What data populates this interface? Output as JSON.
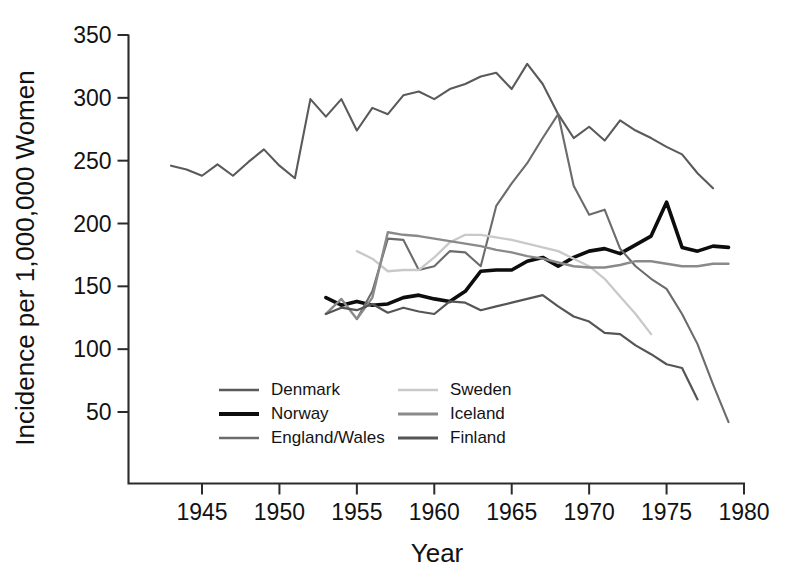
{
  "chart_data": {
    "type": "line",
    "title": "",
    "subtitle": "",
    "xlabel": "Year",
    "ylabel": "Incidence per 1,000,000 Women",
    "xlim": [
      1942,
      1980
    ],
    "ylim": [
      0,
      350
    ],
    "xticks": [
      1945,
      1950,
      1955,
      1960,
      1965,
      1970,
      1975,
      1980
    ],
    "yticks": [
      50,
      100,
      150,
      200,
      250,
      300,
      350
    ],
    "grid": false,
    "legend_position": "inside-lower-left",
    "annotations": [],
    "series": [
      {
        "name": "Denmark",
        "color": "#5a5a5a",
        "width": 2.1,
        "x": [
          1943,
          1944,
          1945,
          1946,
          1947,
          1948,
          1949,
          1950,
          1951,
          1952,
          1953,
          1954,
          1955,
          1956,
          1957,
          1958,
          1959,
          1960,
          1961,
          1962,
          1963,
          1964,
          1965,
          1966,
          1967,
          1968,
          1969,
          1970,
          1971,
          1972,
          1973,
          1974,
          1975,
          1976,
          1977,
          1978
        ],
        "y": [
          246,
          243,
          238,
          247,
          238,
          249,
          259,
          246,
          236,
          299,
          285,
          299,
          274,
          292,
          287,
          302,
          305,
          299,
          307,
          311,
          317,
          320,
          307,
          327,
          311,
          287,
          268,
          277,
          266,
          282,
          274,
          268,
          261,
          255,
          240,
          228
        ]
      },
      {
        "name": "Norway",
        "color": "#0d0d0d",
        "width": 3.6,
        "x": [
          1953,
          1954,
          1955,
          1956,
          1957,
          1958,
          1959,
          1960,
          1961,
          1962,
          1963,
          1964,
          1965,
          1966,
          1967,
          1968,
          1969,
          1970,
          1971,
          1972,
          1973,
          1974,
          1975,
          1976,
          1977,
          1978,
          1979
        ],
        "y": [
          141,
          135,
          138,
          135,
          136,
          141,
          143,
          140,
          138,
          146,
          162,
          163,
          163,
          170,
          173,
          166,
          173,
          178,
          180,
          176,
          183,
          190,
          217,
          181,
          178,
          182,
          181
        ]
      },
      {
        "name": "England/Wales",
        "color": "#6b6b6b",
        "width": 2.1,
        "x": [
          1955,
          1956,
          1957,
          1958,
          1959,
          1960,
          1961,
          1962,
          1963,
          1964,
          1965,
          1966,
          1967,
          1968,
          1969,
          1970,
          1971,
          1972,
          1973,
          1974,
          1975,
          1976,
          1977,
          1978,
          1979
        ],
        "y": [
          124,
          146,
          188,
          187,
          163,
          166,
          178,
          177,
          166,
          214,
          232,
          248,
          268,
          287,
          230,
          207,
          211,
          180,
          166,
          156,
          148,
          128,
          104,
          72,
          42
        ]
      },
      {
        "name": "Sweden",
        "color": "#c9c9c9",
        "width": 2.3,
        "x": [
          1955,
          1956,
          1957,
          1958,
          1959,
          1960,
          1961,
          1962,
          1963,
          1964,
          1965,
          1966,
          1967,
          1968,
          1969,
          1970,
          1971,
          1972,
          1973,
          1974
        ],
        "y": [
          178,
          172,
          162,
          163,
          163,
          173,
          185,
          191,
          191,
          189,
          187,
          184,
          181,
          178,
          172,
          166,
          156,
          142,
          128,
          112
        ]
      },
      {
        "name": "Iceland",
        "color": "#8a8a8a",
        "width": 2.4,
        "x": [
          1953,
          1954,
          1955,
          1956,
          1957,
          1958,
          1959,
          1960,
          1961,
          1962,
          1963,
          1964,
          1965,
          1966,
          1967,
          1968,
          1969,
          1970,
          1971,
          1972,
          1973,
          1974,
          1975,
          1976,
          1977,
          1978,
          1979
        ],
        "y": [
          128,
          140,
          124,
          141,
          193,
          191,
          190,
          188,
          186,
          184,
          182,
          179,
          177,
          174,
          172,
          169,
          166,
          165,
          165,
          167,
          170,
          170,
          168,
          166,
          166,
          168,
          168
        ]
      },
      {
        "name": "Finland",
        "color": "#555555",
        "width": 2.2,
        "x": [
          1953,
          1954,
          1955,
          1956,
          1957,
          1958,
          1959,
          1960,
          1961,
          1962,
          1963,
          1964,
          1965,
          1966,
          1967,
          1968,
          1969,
          1970,
          1971,
          1972,
          1973,
          1974,
          1975,
          1976,
          1977
        ],
        "y": [
          128,
          133,
          131,
          136,
          129,
          133,
          130,
          128,
          138,
          137,
          131,
          134,
          137,
          140,
          143,
          134,
          126,
          122,
          113,
          112,
          103,
          96,
          88,
          85,
          60
        ]
      }
    ]
  },
  "legend": {
    "entries": [
      {
        "label": "Denmark",
        "color": "#5a5a5a",
        "width": 2.6,
        "col": 0,
        "row": 0
      },
      {
        "label": "Norway",
        "color": "#0d0d0d",
        "width": 4.2,
        "col": 0,
        "row": 1
      },
      {
        "label": "England/Wales",
        "color": "#6b6b6b",
        "width": 2.6,
        "col": 0,
        "row": 2
      },
      {
        "label": "Sweden",
        "color": "#c9c9c9",
        "width": 2.6,
        "col": 1,
        "row": 0
      },
      {
        "label": "Iceland",
        "color": "#8a8a8a",
        "width": 3.0,
        "col": 1,
        "row": 1
      },
      {
        "label": "Finland",
        "color": "#555555",
        "width": 3.0,
        "col": 1,
        "row": 2
      }
    ]
  },
  "axes": {
    "x_title": "Year",
    "y_title": "Incidence per 1,000,000 Women",
    "x_tick_labels": [
      "1945",
      "1950",
      "1955",
      "1960",
      "1965",
      "1970",
      "1975",
      "1980"
    ],
    "y_tick_labels": [
      "50",
      "100",
      "150",
      "200",
      "250",
      "300",
      "350"
    ]
  }
}
